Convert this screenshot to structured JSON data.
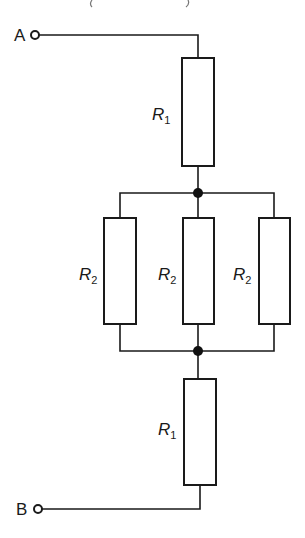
{
  "diagram": {
    "type": "circuit",
    "terminals": [
      {
        "id": "A",
        "label": "A"
      },
      {
        "id": "B",
        "label": "B"
      }
    ],
    "resistors": [
      {
        "id": "r1_top",
        "symbol": "R",
        "subscript": "1"
      },
      {
        "id": "r2_left",
        "symbol": "R",
        "subscript": "2"
      },
      {
        "id": "r2_mid",
        "symbol": "R",
        "subscript": "2"
      },
      {
        "id": "r2_right",
        "symbol": "R",
        "subscript": "2"
      },
      {
        "id": "r1_bottom",
        "symbol": "R",
        "subscript": "1"
      }
    ],
    "topology": "R1 in series with (R2 || R2 || R2) in series with R1",
    "junctions": 2
  }
}
